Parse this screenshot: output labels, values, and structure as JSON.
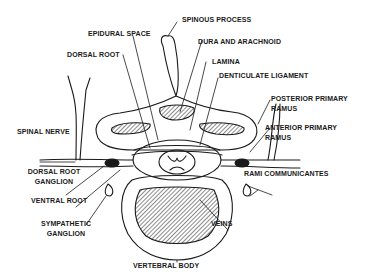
{
  "diagram": {
    "labels": {
      "spinous_process": "SPINOUS PROCESS",
      "epidural_space": "EPIDURAL SPACE",
      "dura_and_arachnoid": "DURA AND ARACHNOID",
      "dorsal_root": "DORSAL ROOT",
      "lamina": "LAMINA",
      "denticulate_ligament": "DENTICULATE LIGAMENT",
      "posterior_primary_ramus_1": "POSTERIOR PRIMARY",
      "posterior_primary_ramus_2": "RAMUS",
      "anterior_primary_ramus_1": "ANTERIOR PRIMARY",
      "anterior_primary_ramus_2": "RAMUS",
      "spinal_nerve": "SPINAL NERVE",
      "dorsal_root_ganglion_1": "DORSAL ROOT",
      "dorsal_root_ganglion_2": "GANGLION",
      "rami_communicantes": "RAMI COMMUNICANTES",
      "ventral_root": "VENTRAL ROOT",
      "sympathetic_ganglion_1": "SYMPATHETIC",
      "sympathetic_ganglion_2": "GANGLION",
      "veins": "VEINS",
      "vertebral_body": "VERTEBRAL BODY"
    },
    "colors": {
      "ink": "#1a1a1a",
      "background": "#ffffff"
    }
  }
}
